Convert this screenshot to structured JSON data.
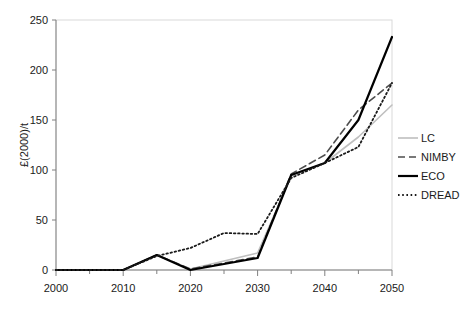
{
  "chart_data": {
    "type": "line",
    "title": "",
    "subtitle": "",
    "xlabel": "",
    "ylabel": "£(2000)/t",
    "xlim": [
      2000,
      2050
    ],
    "ylim": [
      0,
      250
    ],
    "xticks": [
      2000,
      2010,
      2020,
      2030,
      2040,
      2050
    ],
    "xtick_labels": [
      "2000",
      "2010",
      "2020",
      "2030",
      "2040",
      "2050"
    ],
    "xminorticks": [
      2005,
      2015,
      2025,
      2035,
      2045
    ],
    "yticks": [
      0,
      50,
      100,
      150,
      200,
      250
    ],
    "ytick_labels": [
      "0",
      "50",
      "100",
      "150",
      "200",
      "250"
    ],
    "grid": false,
    "legend_position": "right",
    "x": [
      2000,
      2005,
      2010,
      2015,
      2020,
      2025,
      2030,
      2035,
      2040,
      2045,
      2050
    ],
    "series": [
      {
        "name": "LC",
        "style": "solid",
        "color": "#bfbfbf",
        "width": 1.6,
        "values": [
          0,
          0,
          0,
          15,
          1,
          9,
          17,
          94,
          107,
          133,
          165
        ]
      },
      {
        "name": "NIMBY",
        "style": "dashed",
        "color": "#4d4d4d",
        "width": 1.6,
        "values": [
          0,
          0,
          0,
          15,
          1,
          7,
          13,
          96,
          115,
          160,
          187
        ]
      },
      {
        "name": "ECO",
        "style": "solid",
        "color": "#000000",
        "width": 2.2,
        "values": [
          0,
          0,
          0,
          15,
          0,
          6,
          12,
          95,
          107,
          150,
          233
        ]
      },
      {
        "name": "DREAD",
        "style": "dotted",
        "color": "#1a1a1a",
        "width": 1.8,
        "values": [
          0,
          0,
          0,
          14,
          22,
          37,
          36,
          92,
          107,
          123,
          187
        ]
      }
    ]
  },
  "legend": {
    "items": [
      {
        "label": "LC"
      },
      {
        "label": "NIMBY"
      },
      {
        "label": "ECO"
      },
      {
        "label": "DREAD"
      }
    ]
  },
  "axes": {
    "y_title": "£(2000)/t"
  },
  "colors": {
    "plot_border": "#d9d9d9",
    "axis_line": "#808080",
    "tick_text": "#1a1a1a",
    "background": "#ffffff"
  }
}
